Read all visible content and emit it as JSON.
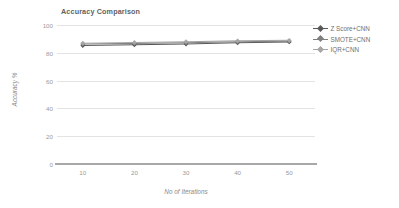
{
  "chart_data": {
    "type": "line",
    "title": "Accuracy Comparison",
    "xlabel": "No of Iterations",
    "ylabel": "Accuracy %",
    "categories": [
      10,
      20,
      30,
      40,
      50
    ],
    "x": [
      10,
      20,
      30,
      40,
      50
    ],
    "xtick_labels": [
      "10",
      "20",
      "30",
      "40",
      "50"
    ],
    "ytick_labels": [
      "0",
      "20",
      "40",
      "60",
      "80",
      "100"
    ],
    "yticks": [
      0,
      20,
      40,
      60,
      80,
      100
    ],
    "ylim": [
      0,
      100
    ],
    "xlim": [
      5,
      55
    ],
    "grid": true,
    "legend_position": "right",
    "series": [
      {
        "name": "Z Score+CNN",
        "values": [
          85.2,
          85.8,
          86.3,
          87.2,
          87.8
        ],
        "color": "#595959",
        "marker": "diamond"
      },
      {
        "name": "SMOTE+CNN",
        "values": [
          86.3,
          86.8,
          87.2,
          87.9,
          88.4
        ],
        "color": "#7f7f7f",
        "marker": "diamond"
      },
      {
        "name": "IQR+CNN",
        "values": [
          86.9,
          87.4,
          88.0,
          88.6,
          89.0
        ],
        "color": "#a6a6a6",
        "marker": "diamond"
      }
    ]
  },
  "colors": {
    "gridline": "#e3e3e3",
    "axis": "#a8a8a8",
    "tick_text": "#9a9a9a",
    "title_text": "#5f5f5f",
    "background": "#ffffff"
  }
}
